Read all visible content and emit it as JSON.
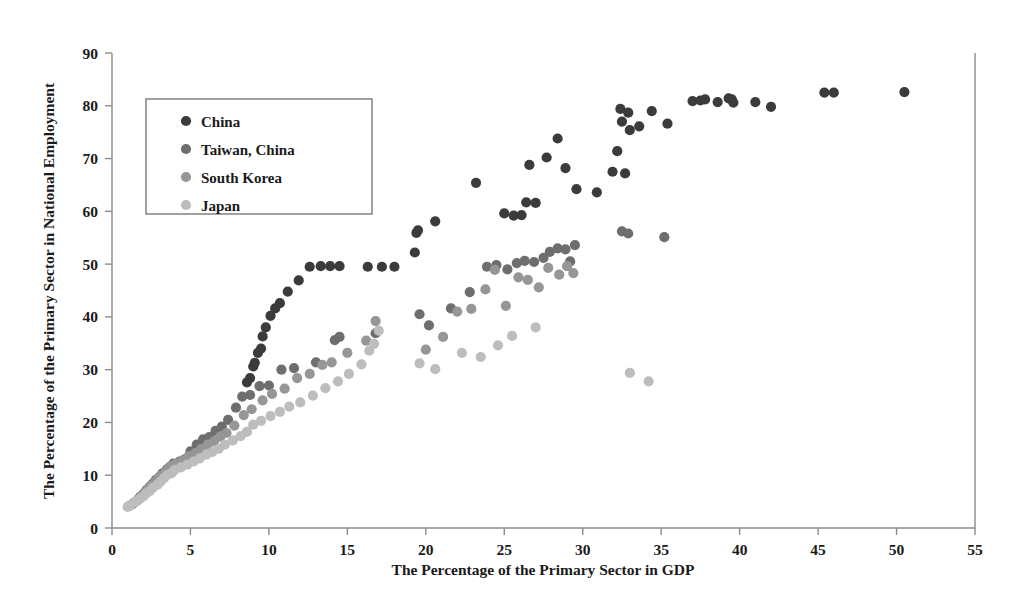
{
  "chart_data": {
    "type": "scatter",
    "title": "",
    "xlabel": "The Percentage of the Primary Sector in GDP",
    "ylabel": "The Percentage of the Primary Sector in National Employment",
    "xlim": [
      0,
      55
    ],
    "ylim": [
      0,
      90
    ],
    "xticks": [
      0,
      5,
      10,
      15,
      20,
      25,
      30,
      35,
      40,
      45,
      50,
      55
    ],
    "yticks": [
      0,
      10,
      20,
      30,
      40,
      50,
      60,
      70,
      80,
      90
    ],
    "grid": false,
    "legend_position": "upper-left",
    "series": [
      {
        "name": "China",
        "color": "#3b3b3b",
        "points": [
          [
            8.6,
            27.6
          ],
          [
            8.8,
            28.4
          ],
          [
            9.0,
            30.6
          ],
          [
            9.1,
            31.3
          ],
          [
            9.3,
            33.2
          ],
          [
            9.5,
            34.0
          ],
          [
            9.6,
            36.3
          ],
          [
            9.8,
            38.0
          ],
          [
            10.1,
            40.2
          ],
          [
            10.4,
            41.6
          ],
          [
            10.7,
            42.6
          ],
          [
            11.2,
            44.8
          ],
          [
            11.9,
            46.9
          ],
          [
            12.6,
            49.5
          ],
          [
            13.3,
            49.6
          ],
          [
            13.9,
            49.6
          ],
          [
            14.5,
            49.6
          ],
          [
            16.3,
            49.5
          ],
          [
            17.2,
            49.5
          ],
          [
            18.0,
            49.5
          ],
          [
            19.3,
            52.2
          ],
          [
            19.4,
            55.9
          ],
          [
            19.5,
            56.4
          ],
          [
            20.6,
            58.1
          ],
          [
            23.2,
            65.4
          ],
          [
            25.0,
            59.6
          ],
          [
            25.6,
            59.2
          ],
          [
            26.1,
            59.3
          ],
          [
            26.4,
            61.7
          ],
          [
            26.6,
            68.8
          ],
          [
            27.0,
            61.6
          ],
          [
            27.7,
            70.2
          ],
          [
            28.4,
            73.8
          ],
          [
            28.9,
            68.2
          ],
          [
            29.6,
            64.2
          ],
          [
            30.9,
            63.6
          ],
          [
            31.9,
            67.5
          ],
          [
            32.2,
            71.4
          ],
          [
            32.4,
            79.4
          ],
          [
            32.5,
            77.0
          ],
          [
            32.7,
            67.2
          ],
          [
            32.9,
            78.7
          ],
          [
            33.0,
            75.4
          ],
          [
            33.6,
            76.1
          ],
          [
            34.4,
            79.0
          ],
          [
            35.4,
            76.6
          ],
          [
            37.0,
            80.9
          ],
          [
            37.5,
            81.0
          ],
          [
            37.8,
            81.2
          ],
          [
            38.6,
            80.7
          ],
          [
            39.3,
            81.4
          ],
          [
            39.5,
            81.2
          ],
          [
            39.6,
            80.6
          ],
          [
            41.0,
            80.7
          ],
          [
            42.0,
            79.8
          ],
          [
            45.4,
            82.5
          ],
          [
            46.0,
            82.5
          ],
          [
            50.5,
            82.6
          ]
        ]
      },
      {
        "name": "Taiwan, China",
        "color": "#6e6e6e",
        "points": [
          [
            1.3,
            4.5
          ],
          [
            1.6,
            5.2
          ],
          [
            1.8,
            5.9
          ],
          [
            2.0,
            6.4
          ],
          [
            2.2,
            7.2
          ],
          [
            2.4,
            7.8
          ],
          [
            2.6,
            8.4
          ],
          [
            2.8,
            9.1
          ],
          [
            3.0,
            9.6
          ],
          [
            3.2,
            10.3
          ],
          [
            3.5,
            11.1
          ],
          [
            3.7,
            11.6
          ],
          [
            3.9,
            12.2
          ],
          [
            4.3,
            12.6
          ],
          [
            4.7,
            13.1
          ],
          [
            5.0,
            14.5
          ],
          [
            5.4,
            15.8
          ],
          [
            5.8,
            16.8
          ],
          [
            6.2,
            17.2
          ],
          [
            6.6,
            18.4
          ],
          [
            7.0,
            19.2
          ],
          [
            7.4,
            20.5
          ],
          [
            7.9,
            22.8
          ],
          [
            8.3,
            24.9
          ],
          [
            8.8,
            25.2
          ],
          [
            9.4,
            26.9
          ],
          [
            10.0,
            27.0
          ],
          [
            10.8,
            30.0
          ],
          [
            11.6,
            30.3
          ],
          [
            13.0,
            31.4
          ],
          [
            14.2,
            35.6
          ],
          [
            14.5,
            36.2
          ],
          [
            16.8,
            36.9
          ],
          [
            19.6,
            40.5
          ],
          [
            20.2,
            38.4
          ],
          [
            21.6,
            41.6
          ],
          [
            22.8,
            44.7
          ],
          [
            23.9,
            49.5
          ],
          [
            24.5,
            49.8
          ],
          [
            25.2,
            49.0
          ],
          [
            25.8,
            50.2
          ],
          [
            26.3,
            50.6
          ],
          [
            26.9,
            50.4
          ],
          [
            27.5,
            51.2
          ],
          [
            27.9,
            52.3
          ],
          [
            28.4,
            53.0
          ],
          [
            28.9,
            52.8
          ],
          [
            29.2,
            50.5
          ],
          [
            29.5,
            53.6
          ],
          [
            32.5,
            56.2
          ],
          [
            32.9,
            55.8
          ],
          [
            35.2,
            55.1
          ]
        ]
      },
      {
        "name": "South Korea",
        "color": "#969696",
        "points": [
          [
            1.1,
            4.2
          ],
          [
            1.4,
            4.8
          ],
          [
            1.7,
            5.5
          ],
          [
            1.9,
            6.1
          ],
          [
            2.1,
            6.8
          ],
          [
            2.3,
            7.4
          ],
          [
            2.5,
            8.0
          ],
          [
            2.7,
            8.5
          ],
          [
            2.9,
            9.2
          ],
          [
            3.1,
            9.9
          ],
          [
            3.4,
            10.6
          ],
          [
            3.6,
            11.2
          ],
          [
            3.8,
            11.8
          ],
          [
            4.1,
            12.2
          ],
          [
            4.5,
            12.8
          ],
          [
            4.9,
            13.6
          ],
          [
            5.3,
            14.2
          ],
          [
            5.7,
            15.0
          ],
          [
            6.1,
            15.8
          ],
          [
            6.5,
            16.4
          ],
          [
            6.9,
            17.3
          ],
          [
            7.3,
            18.0
          ],
          [
            7.8,
            19.4
          ],
          [
            8.4,
            21.4
          ],
          [
            8.9,
            22.5
          ],
          [
            9.6,
            24.2
          ],
          [
            10.2,
            25.4
          ],
          [
            11.0,
            26.4
          ],
          [
            11.8,
            28.4
          ],
          [
            12.6,
            29.2
          ],
          [
            13.4,
            30.9
          ],
          [
            14.0,
            31.4
          ],
          [
            15.0,
            33.2
          ],
          [
            16.2,
            35.5
          ],
          [
            16.8,
            39.2
          ],
          [
            20.0,
            33.8
          ],
          [
            21.1,
            36.2
          ],
          [
            22.0,
            41.0
          ],
          [
            22.9,
            41.5
          ],
          [
            23.8,
            45.2
          ],
          [
            24.4,
            48.9
          ],
          [
            25.1,
            42.1
          ],
          [
            25.9,
            47.5
          ],
          [
            26.5,
            47.0
          ],
          [
            27.2,
            45.6
          ],
          [
            27.8,
            49.3
          ],
          [
            28.5,
            48.0
          ],
          [
            29.0,
            49.6
          ],
          [
            29.4,
            48.3
          ]
        ]
      },
      {
        "name": "Japan",
        "color": "#bdbdbd",
        "points": [
          [
            1.0,
            4.0
          ],
          [
            1.2,
            4.4
          ],
          [
            1.5,
            5.0
          ],
          [
            1.8,
            5.6
          ],
          [
            2.0,
            6.0
          ],
          [
            2.2,
            6.6
          ],
          [
            2.4,
            7.0
          ],
          [
            2.6,
            7.6
          ],
          [
            2.9,
            8.2
          ],
          [
            3.1,
            8.8
          ],
          [
            3.3,
            9.4
          ],
          [
            3.5,
            10.0
          ],
          [
            3.8,
            10.4
          ],
          [
            4.0,
            11.0
          ],
          [
            4.4,
            11.5
          ],
          [
            4.8,
            12.0
          ],
          [
            5.2,
            12.6
          ],
          [
            5.6,
            13.2
          ],
          [
            6.0,
            13.9
          ],
          [
            6.4,
            14.4
          ],
          [
            6.8,
            15.0
          ],
          [
            7.2,
            15.8
          ],
          [
            7.7,
            16.6
          ],
          [
            8.2,
            17.4
          ],
          [
            8.6,
            18.2
          ],
          [
            9.0,
            19.6
          ],
          [
            9.5,
            20.3
          ],
          [
            10.1,
            21.2
          ],
          [
            10.7,
            22.0
          ],
          [
            11.3,
            23.0
          ],
          [
            12.0,
            23.8
          ],
          [
            12.8,
            25.1
          ],
          [
            13.6,
            26.5
          ],
          [
            14.4,
            27.8
          ],
          [
            15.1,
            29.2
          ],
          [
            15.9,
            31.0
          ],
          [
            16.4,
            33.6
          ],
          [
            16.7,
            34.9
          ],
          [
            17.0,
            37.4
          ],
          [
            19.6,
            31.2
          ],
          [
            20.6,
            30.1
          ],
          [
            22.3,
            33.2
          ],
          [
            23.5,
            32.4
          ],
          [
            24.6,
            34.6
          ],
          [
            25.5,
            36.4
          ],
          [
            27.0,
            38.0
          ],
          [
            33.0,
            29.4
          ],
          [
            34.2,
            27.8
          ]
        ]
      }
    ],
    "legend": [
      {
        "label": "China",
        "color": "#3b3b3b"
      },
      {
        "label": "Taiwan, China",
        "color": "#6e6e6e"
      },
      {
        "label": "South Korea",
        "color": "#969696"
      },
      {
        "label": "Japan",
        "color": "#bdbdbd"
      }
    ]
  }
}
